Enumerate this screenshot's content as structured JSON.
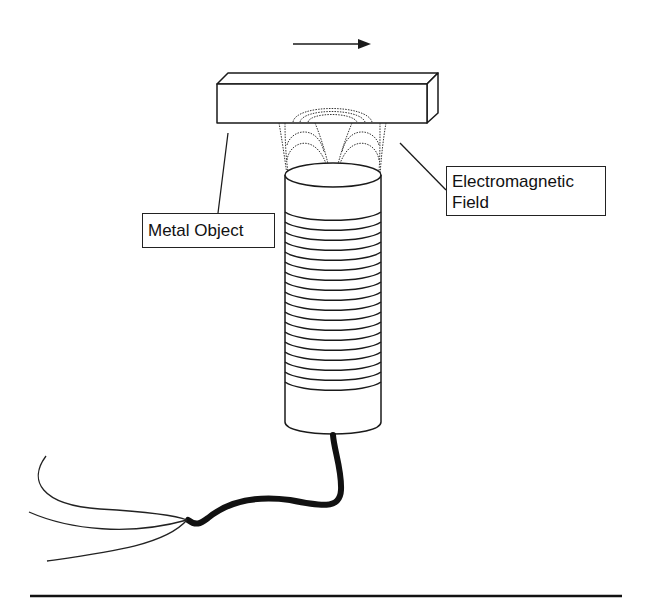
{
  "diagram": {
    "labels": {
      "metal_object": "Metal Object",
      "field_line1": "Electromagnetic",
      "field_line2": "Field"
    },
    "motion_direction": "right",
    "coil_turns_visible": 18,
    "colors": {
      "ink": "#1a1a1a",
      "background": "#ffffff"
    }
  }
}
